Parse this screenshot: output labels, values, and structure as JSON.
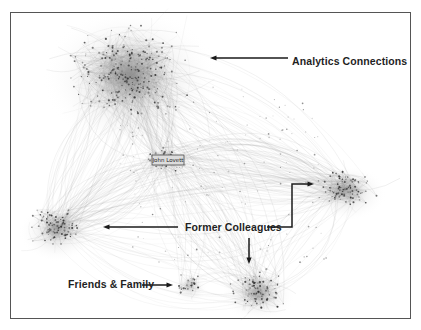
{
  "figure": {
    "background": "#ffffff",
    "frame": {
      "x": 10.5,
      "y": 12.5,
      "width": 400,
      "height": 306,
      "border_color": "#555555",
      "border_width": 1
    }
  },
  "graph": {
    "type": "network",
    "center_label": "John Lovett",
    "center_label_box": {
      "x": 152,
      "y": 155,
      "width": 32,
      "height": 10,
      "fill": "#dcdcdc",
      "border": "#4a4a4a",
      "font_size": 5.5
    },
    "node_color": "#2e2e2e",
    "edge_color": "#8f8f8f",
    "seed": 1337,
    "clusters": [
      {
        "id": "analytics",
        "label": "Analytics Connections",
        "cx": 130,
        "cy": 74,
        "rx": 60,
        "ry": 52,
        "halo_rx": 88,
        "halo_ry": 72,
        "nodes": 230,
        "intra_edges": 340,
        "halo_opacity": 0.5,
        "core_opacity": 0.85
      },
      {
        "id": "hub",
        "label": "John Lovett",
        "cx": 167,
        "cy": 160,
        "rx": 26,
        "ry": 15,
        "halo_rx": 30,
        "halo_ry": 18,
        "nodes": 40,
        "intra_edges": 55,
        "halo_opacity": 0.12,
        "core_opacity": 0
      },
      {
        "id": "former-left",
        "label": "Former Colleagues",
        "cx": 57,
        "cy": 228,
        "rx": 27,
        "ry": 22,
        "halo_rx": 38,
        "halo_ry": 30,
        "nodes": 85,
        "intra_edges": 130,
        "halo_opacity": 0.45,
        "core_opacity": 0.6
      },
      {
        "id": "former-right",
        "label": "Former Colleagues",
        "cx": 347,
        "cy": 189,
        "rx": 30,
        "ry": 20,
        "halo_rx": 40,
        "halo_ry": 28,
        "nodes": 85,
        "intra_edges": 130,
        "halo_opacity": 0.45,
        "core_opacity": 0.6
      },
      {
        "id": "former-bottom",
        "label": "Former Colleagues",
        "cx": 258,
        "cy": 291,
        "rx": 29,
        "ry": 22,
        "halo_rx": 38,
        "halo_ry": 27,
        "nodes": 80,
        "intra_edges": 115,
        "halo_opacity": 0.45,
        "core_opacity": 0.55
      },
      {
        "id": "friends-family",
        "label": "Friends & Family",
        "cx": 190,
        "cy": 284,
        "rx": 14,
        "ry": 13,
        "halo_rx": 18,
        "halo_ry": 16,
        "nodes": 26,
        "intra_edges": 36,
        "halo_opacity": 0.3,
        "core_opacity": 0.3
      }
    ],
    "links": [
      {
        "from": 0,
        "to": 1,
        "count": 70
      },
      {
        "from": 0,
        "to": 2,
        "count": 45
      },
      {
        "from": 0,
        "to": 3,
        "count": 40
      },
      {
        "from": 0,
        "to": 4,
        "count": 25
      },
      {
        "from": 1,
        "to": 2,
        "count": 40
      },
      {
        "from": 1,
        "to": 3,
        "count": 48
      },
      {
        "from": 1,
        "to": 4,
        "count": 30
      },
      {
        "from": 1,
        "to": 5,
        "count": 10
      },
      {
        "from": 2,
        "to": 3,
        "count": 28
      },
      {
        "from": 2,
        "to": 4,
        "count": 14
      },
      {
        "from": 3,
        "to": 4,
        "count": 18
      },
      {
        "from": 5,
        "to": 4,
        "count": 6
      }
    ],
    "scatter_nodes": 140,
    "scatter_region": {
      "x0": 120,
      "y0": 85,
      "x1": 330,
      "y1": 265
    }
  },
  "annotations": [
    {
      "label": "Analytics Connections",
      "label_x": 292,
      "label_y": 65,
      "font_size": 10.5,
      "arrow_color": "#1a1a1a",
      "paths": [
        {
          "points": [
            [
              288,
              58
            ],
            [
              214,
              58
            ]
          ]
        }
      ]
    },
    {
      "label": "Former Colleagues",
      "label_x": 185,
      "label_y": 231,
      "font_size": 10.5,
      "arrow_color": "#1a1a1a",
      "paths": [
        {
          "points": [
            [
              178,
              227
            ],
            [
              107,
              227
            ]
          ]
        },
        {
          "points": [
            [
              267,
              227
            ],
            [
              292,
              227
            ],
            [
              292,
              184
            ],
            [
              310,
              184
            ]
          ]
        },
        {
          "points": [
            [
              249,
              238
            ],
            [
              249,
              260
            ]
          ]
        }
      ]
    },
    {
      "label": "Friends & Family",
      "label_x": 68,
      "label_y": 288,
      "font_size": 10.5,
      "arrow_color": "#1a1a1a",
      "paths": [
        {
          "points": [
            [
              142,
              285
            ],
            [
              169,
              285
            ]
          ]
        }
      ]
    }
  ]
}
